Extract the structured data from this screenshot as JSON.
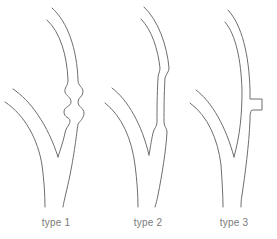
{
  "figure": {
    "panels": [
      {
        "id": "type1",
        "label": "type 1",
        "variant": "multiple-bulges",
        "label_x": 26
      },
      {
        "id": "type2",
        "label": "type 2",
        "variant": "long-narrowing",
        "label_x": 118
      },
      {
        "id": "type3",
        "label": "type 3",
        "variant": "side-stub",
        "label_x": 204
      }
    ],
    "stroke_color": "#6e6e6e",
    "label_color": "#7a7a7a",
    "background": "#ffffff"
  }
}
